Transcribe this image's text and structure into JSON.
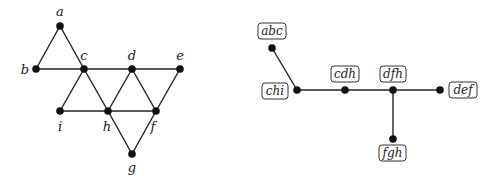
{
  "left_graph": {
    "nodes": [
      {
        "id": "a",
        "label": "a",
        "x": 60,
        "y": 26,
        "lx": 60,
        "ly": 16
      },
      {
        "id": "b",
        "label": "b",
        "x": 36,
        "y": 69,
        "lx": 25,
        "ly": 74
      },
      {
        "id": "c",
        "label": "c",
        "x": 84,
        "y": 69,
        "lx": 84,
        "ly": 60
      },
      {
        "id": "d",
        "label": "d",
        "x": 132,
        "y": 69,
        "lx": 132,
        "ly": 60
      },
      {
        "id": "e",
        "label": "e",
        "x": 180,
        "y": 69,
        "lx": 180,
        "ly": 60
      },
      {
        "id": "i",
        "label": "i",
        "x": 60,
        "y": 111,
        "lx": 60,
        "ly": 131
      },
      {
        "id": "h",
        "label": "h",
        "x": 108,
        "y": 111,
        "lx": 107,
        "ly": 131
      },
      {
        "id": "f",
        "label": "f",
        "x": 156,
        "y": 111,
        "lx": 153,
        "ly": 131
      },
      {
        "id": "g",
        "label": "g",
        "x": 132,
        "y": 154,
        "lx": 132,
        "ly": 172
      }
    ],
    "edges": [
      [
        "a",
        "b"
      ],
      [
        "a",
        "c"
      ],
      [
        "b",
        "c"
      ],
      [
        "c",
        "d"
      ],
      [
        "d",
        "e"
      ],
      [
        "c",
        "i"
      ],
      [
        "c",
        "h"
      ],
      [
        "i",
        "h"
      ],
      [
        "h",
        "d"
      ],
      [
        "d",
        "f"
      ],
      [
        "h",
        "f"
      ],
      [
        "f",
        "e"
      ],
      [
        "h",
        "g"
      ],
      [
        "g",
        "f"
      ]
    ]
  },
  "right_graph": {
    "nodes": [
      {
        "id": "abc",
        "label": "abc",
        "x": 272,
        "y": 48,
        "bx": 258,
        "by": 23,
        "bw": 28,
        "bh": 16
      },
      {
        "id": "chi",
        "label": "chi",
        "x": 297,
        "y": 90,
        "bx": 262,
        "by": 83,
        "bw": 26,
        "bh": 16
      },
      {
        "id": "cdh",
        "label": "cdh",
        "x": 345,
        "y": 90,
        "bx": 331,
        "by": 66,
        "bw": 28,
        "bh": 16
      },
      {
        "id": "dfh",
        "label": "dfh",
        "x": 393,
        "y": 90,
        "bx": 380,
        "by": 66,
        "bw": 26,
        "bh": 16
      },
      {
        "id": "def",
        "label": "def",
        "x": 440,
        "y": 90,
        "bx": 449,
        "by": 82,
        "bw": 28,
        "bh": 16
      },
      {
        "id": "fgh",
        "label": "fgh",
        "x": 393,
        "y": 139,
        "bx": 379,
        "by": 145,
        "bw": 27,
        "bh": 16
      }
    ],
    "edges": [
      [
        "abc",
        "chi"
      ],
      [
        "chi",
        "cdh"
      ],
      [
        "cdh",
        "dfh"
      ],
      [
        "dfh",
        "def"
      ],
      [
        "dfh",
        "fgh"
      ]
    ]
  }
}
